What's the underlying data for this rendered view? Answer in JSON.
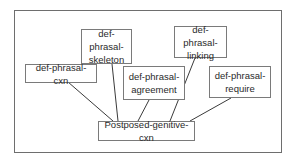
{
  "diagram": {
    "root": {
      "id": "postposed",
      "label": "Postposed-genitive-cxn"
    },
    "parents": [
      {
        "id": "cxn",
        "label": "def-phrasal-cxn"
      },
      {
        "id": "skeleton",
        "label": "def-phrasal-skeleton"
      },
      {
        "id": "agreement",
        "label": "def-phrasal-agreement"
      },
      {
        "id": "linking",
        "label": "def-phrasal-linking"
      },
      {
        "id": "require",
        "label": "def-phrasal-require"
      }
    ],
    "edges": [
      {
        "from": "postposed",
        "to": "cxn"
      },
      {
        "from": "postposed",
        "to": "skeleton"
      },
      {
        "from": "postposed",
        "to": "agreement"
      },
      {
        "from": "postposed",
        "to": "linking"
      },
      {
        "from": "postposed",
        "to": "require"
      }
    ],
    "colors": {
      "border": "#7a7a7a",
      "text": "#2a2a2a",
      "line": "#3a3a3a"
    }
  }
}
